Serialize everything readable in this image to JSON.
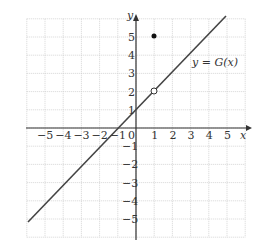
{
  "chart_data": {
    "type": "line",
    "title": "",
    "xlabel": "x",
    "ylabel": "y",
    "xlim": [
      -6,
      6
    ],
    "ylim": [
      -6,
      6
    ],
    "grid": true,
    "x_ticks": [
      "-5",
      "-4",
      "-3",
      "-2",
      "-1",
      "0",
      "1",
      "2",
      "3",
      "4",
      "5"
    ],
    "y_ticks": [
      "-5",
      "-4",
      "-3",
      "-2",
      "-1",
      "1",
      "2",
      "3",
      "4",
      "5"
    ],
    "series": [
      {
        "name": "y = G(x)",
        "equation": "y = x + 1",
        "x": [
          -5.8,
          5
        ],
        "y": [
          -4.8,
          6
        ]
      }
    ],
    "points": [
      {
        "x": 1,
        "y": 5,
        "style": "filled"
      },
      {
        "x": 1,
        "y": 2,
        "style": "open"
      }
    ],
    "annotation": "y = G(x)"
  },
  "labels": {
    "x_axis": "x",
    "y_axis": "y",
    "curve": "y = G(x)",
    "origin": "0"
  }
}
